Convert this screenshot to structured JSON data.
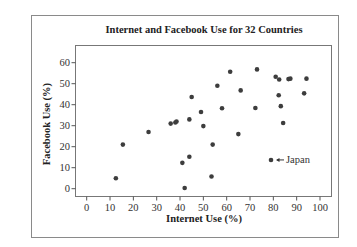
{
  "chart_data": {
    "type": "scatter",
    "title": "Internet and Facebook Use for 32 Countries",
    "xlabel": "Internet Use (%)",
    "ylabel": "Facebook Use (%)",
    "xlim": [
      0,
      100
    ],
    "ylim": [
      0,
      60
    ],
    "xticks": [
      0,
      10,
      20,
      30,
      40,
      50,
      60,
      70,
      80,
      90,
      100
    ],
    "yticks": [
      0,
      10,
      20,
      30,
      40,
      50,
      60
    ],
    "grid": false,
    "legend": null,
    "points": [
      {
        "x": 12.5,
        "y": 5
      },
      {
        "x": 15.5,
        "y": 21
      },
      {
        "x": 26.5,
        "y": 27
      },
      {
        "x": 36,
        "y": 31
      },
      {
        "x": 38,
        "y": 31.5
      },
      {
        "x": 38.5,
        "y": 32
      },
      {
        "x": 42,
        "y": 0.3
      },
      {
        "x": 41,
        "y": 12.3
      },
      {
        "x": 44,
        "y": 15.2
      },
      {
        "x": 44,
        "y": 33
      },
      {
        "x": 45,
        "y": 43.7
      },
      {
        "x": 49,
        "y": 36.5
      },
      {
        "x": 50,
        "y": 29.8
      },
      {
        "x": 53.5,
        "y": 5.8
      },
      {
        "x": 54,
        "y": 21
      },
      {
        "x": 56,
        "y": 49
      },
      {
        "x": 58,
        "y": 38.3
      },
      {
        "x": 61.5,
        "y": 55.7
      },
      {
        "x": 65,
        "y": 26
      },
      {
        "x": 66,
        "y": 46.8
      },
      {
        "x": 72.3,
        "y": 38.4
      },
      {
        "x": 73,
        "y": 56.8
      },
      {
        "x": 79,
        "y": 13.7,
        "label": "Japan"
      },
      {
        "x": 81,
        "y": 53.3
      },
      {
        "x": 82.5,
        "y": 52
      },
      {
        "x": 82.3,
        "y": 44.5
      },
      {
        "x": 83.2,
        "y": 39.3
      },
      {
        "x": 84.2,
        "y": 31.3
      },
      {
        "x": 86.5,
        "y": 52.2
      },
      {
        "x": 87.3,
        "y": 52.4
      },
      {
        "x": 93.2,
        "y": 45.4
      },
      {
        "x": 94.2,
        "y": 52.4
      }
    ],
    "annotations": [
      {
        "text": "Japan",
        "x": 79,
        "y": 13.7,
        "arrow": true
      }
    ]
  }
}
